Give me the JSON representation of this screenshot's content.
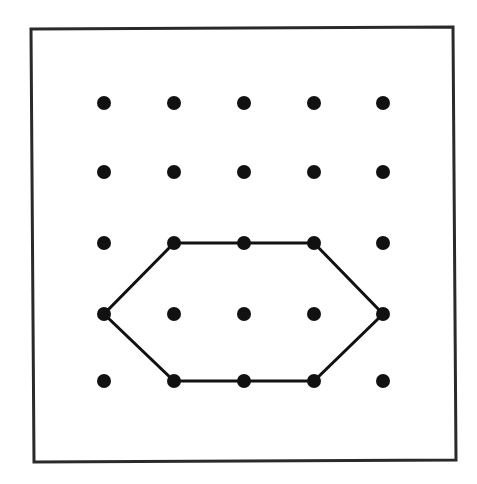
{
  "diagram": {
    "type": "geoboard",
    "colors": {
      "background": "#ffffff",
      "frame": "#2a2a2a",
      "dot": "#111111",
      "shape": "#111111"
    },
    "frame": {
      "corners": [
        [
          31,
          29
        ],
        [
          453,
          27
        ],
        [
          456,
          460
        ],
        [
          34,
          462
        ]
      ],
      "stroke_width": 3
    },
    "grid": {
      "rows": 5,
      "cols": 5,
      "x_positions": [
        104,
        174,
        244,
        314,
        383
      ],
      "y_positions": [
        103,
        172,
        243,
        314,
        381
      ],
      "dot_radius": 7
    },
    "hexagon": {
      "vertices_grid": [
        [
          1,
          2
        ],
        [
          3,
          2
        ],
        [
          4,
          3
        ],
        [
          3,
          4
        ],
        [
          1,
          4
        ],
        [
          0,
          3
        ]
      ],
      "stroke_width": 3
    }
  }
}
